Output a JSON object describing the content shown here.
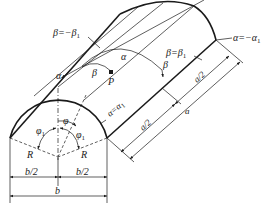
{
  "figure": {
    "labels": {
      "beta_neg_edge": "β=−β",
      "beta_neg_edge_sub": "1",
      "alpha_neg_edge": "α=−α",
      "alpha_neg_edge_sub": "1",
      "beta_pos_edge": "β=β",
      "beta_pos_edge_sub": "1",
      "alpha_pos_edge": "α=α",
      "alpha_pos_edge_sub": "1",
      "alpha_axis": "α",
      "alpha_axis_mid": "α",
      "beta_arc": "β",
      "beta_arc_right": "β",
      "point": "P",
      "phi": "φ",
      "phi1_left": "φ",
      "phi1_left_sub": "1",
      "phi1_right": "φ",
      "phi1_right_sub": "1",
      "radius_left": "R",
      "radius_right": "R",
      "half_width_left": "b/2",
      "half_width_right": "b/2",
      "width": "b",
      "half_length_upper": "a/2",
      "half_length_lower": "a/2",
      "length": "a"
    }
  }
}
